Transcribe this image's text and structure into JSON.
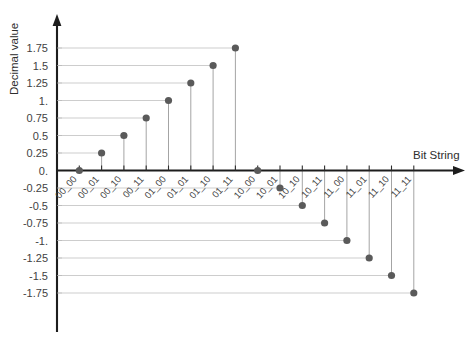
{
  "chart_data": {
    "type": "scatter",
    "title": "",
    "subtitle": "",
    "xlabel": "Bit String",
    "ylabel": "Decimal value",
    "grid": true,
    "legend": false,
    "legend_position": "none",
    "style_note": "stem-plot: horizontal gridline from y-axis to marker, vertical stem from marker to x-axis",
    "marker_color": "#5a5a5a",
    "gridline_color": "#b7b7b7",
    "axis_color": "#1d1d1d",
    "categories": [
      "00_00",
      "00_01",
      "00_10",
      "00_11",
      "01_00",
      "01_01",
      "01_10",
      "01_11",
      "10_00",
      "10_01",
      "10_10",
      "10_11",
      "11_00",
      "11_01",
      "11_10",
      "11_11"
    ],
    "values": [
      0,
      0.25,
      0.5,
      0.75,
      1,
      1.25,
      1.5,
      1.75,
      0,
      -0.25,
      -0.5,
      -0.75,
      -1,
      -1.25,
      -1.5,
      -1.75
    ],
    "points": [
      {
        "category": "00_00",
        "value": 0
      },
      {
        "category": "00_01",
        "value": 0.25
      },
      {
        "category": "00_10",
        "value": 0.5
      },
      {
        "category": "00_11",
        "value": 0.75
      },
      {
        "category": "01_00",
        "value": 1
      },
      {
        "category": "01_01",
        "value": 1.25
      },
      {
        "category": "01_10",
        "value": 1.5
      },
      {
        "category": "01_11",
        "value": 1.75
      },
      {
        "category": "10_00",
        "value": 0
      },
      {
        "category": "10_01",
        "value": -0.25
      },
      {
        "category": "10_10",
        "value": -0.5
      },
      {
        "category": "10_11",
        "value": -0.75
      },
      {
        "category": "11_00",
        "value": -1
      },
      {
        "category": "11_01",
        "value": -1.25
      },
      {
        "category": "11_10",
        "value": -1.5
      },
      {
        "category": "11_11",
        "value": -1.75
      }
    ],
    "ylim": [
      -1.75,
      1.75
    ],
    "ytick_values": [
      1.75,
      1.5,
      1.25,
      1,
      0.75,
      0.5,
      0.25,
      0,
      -0.25,
      -0.5,
      -0.75,
      -1,
      -1.25,
      -1.5,
      -1.75
    ],
    "ytick_labels": [
      "1.75",
      "1.5",
      "1.25",
      "1.",
      "0.75",
      "0.5",
      "0.25",
      "0.",
      "-0.25",
      "-0.5",
      "-0.75",
      "-1.",
      "-1.25",
      "-1.5",
      "-1.75"
    ],
    "xtick_labels": [
      "00_00",
      "00_01",
      "00_10",
      "00_11",
      "01_00",
      "01_01",
      "01_10",
      "01_11",
      "10_00",
      "10_01",
      "10_10",
      "10_11",
      "11_00",
      "11_01",
      "11_10",
      "11_11"
    ],
    "xtick_rotation_deg": -48
  },
  "axes": {
    "x_axis_title": "Bit String",
    "y_axis_title": "Decimal value"
  }
}
